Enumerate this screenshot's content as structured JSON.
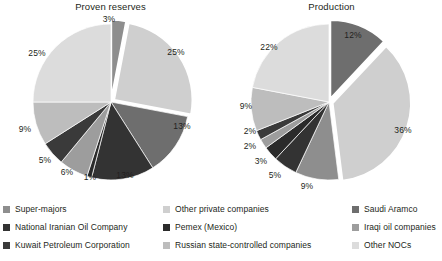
{
  "chart_data": [
    {
      "type": "pie",
      "title": "Proven reserves",
      "unit": "%",
      "labels_shown": true,
      "legend_position": "bottom",
      "grid": false,
      "categories": [
        "Super-majors",
        "Other private companies",
        "Saudi Aramco",
        "National Iranian Oil Company",
        "Pemex (Mexico)",
        "Iraqi oil companies",
        "Kuwait Petroleum Corporation",
        "Russian state-controlled companies",
        "Other NOCs"
      ],
      "values": [
        3,
        25,
        13,
        13,
        1,
        6,
        5,
        9,
        25
      ],
      "value_labels": [
        "3%",
        "25%",
        "13%",
        "13%",
        "1%",
        "6%",
        "5%",
        "9%",
        "25%"
      ],
      "exploded": [
        "Super-majors",
        "Other private companies"
      ]
    },
    {
      "type": "pie",
      "title": "Production",
      "unit": "%",
      "labels_shown": true,
      "legend_position": "bottom",
      "grid": false,
      "categories": [
        "Saudi Aramco",
        "Other private companies",
        "Super-majors",
        "National Iranian Oil Company",
        "Pemex (Mexico)",
        "Iraqi oil companies",
        "Kuwait Petroleum Corporation",
        "Russian state-controlled companies",
        "Other NOCs"
      ],
      "values": [
        12,
        36,
        9,
        5,
        3,
        2,
        2,
        9,
        22
      ],
      "value_labels": [
        "12%",
        "36%",
        "9%",
        "5%",
        "3%",
        "2%",
        "2%",
        "9%",
        "22%"
      ],
      "exploded": [
        "Saudi Aramco",
        "Other private companies"
      ]
    }
  ],
  "panels": {
    "left": {
      "title": "Proven reserves",
      "labels": [
        {
          "text": "3%",
          "x": 109,
          "y": 19
        },
        {
          "text": "25%",
          "x": 176,
          "y": 52
        },
        {
          "text": "13%",
          "x": 182,
          "y": 126
        },
        {
          "text": "13%",
          "x": 125,
          "y": 175
        },
        {
          "text": "1%",
          "x": 90,
          "y": 177
        },
        {
          "text": "6%",
          "x": 67,
          "y": 172
        },
        {
          "text": "5%",
          "x": 45,
          "y": 160
        },
        {
          "text": "9%",
          "x": 25,
          "y": 129
        },
        {
          "text": "25%",
          "x": 37,
          "y": 53
        }
      ]
    },
    "right": {
      "title": "Production",
      "labels": [
        {
          "text": "12%",
          "x": 353,
          "y": 35
        },
        {
          "text": "36%",
          "x": 403,
          "y": 130
        },
        {
          "text": "9%",
          "x": 307,
          "y": 186
        },
        {
          "text": "5%",
          "x": 275,
          "y": 175
        },
        {
          "text": "3%",
          "x": 261,
          "y": 161
        },
        {
          "text": "2%",
          "x": 250,
          "y": 146
        },
        {
          "text": "2%",
          "x": 250,
          "y": 131
        },
        {
          "text": "9%",
          "x": 246,
          "y": 106
        },
        {
          "text": "22%",
          "x": 269,
          "y": 47
        }
      ]
    }
  },
  "legend": {
    "columns": [
      {
        "items": [
          {
            "label": "Super-majors",
            "color": "#8e8e8e"
          },
          {
            "label": "National Iranian Oil Company",
            "color": "#333333"
          },
          {
            "label": "Kuwait Petroleum Corporation",
            "color": "#3a3a3a"
          }
        ]
      },
      {
        "items": [
          {
            "label": "Other private companies",
            "color": "#cfcfcf"
          },
          {
            "label": "Pemex (Mexico)",
            "color": "#2b2b2b"
          },
          {
            "label": "Russian state-controlled companies",
            "color": "#bdbdbd"
          }
        ]
      },
      {
        "items": [
          {
            "label": "Saudi Aramco",
            "color": "#6e6e6e"
          },
          {
            "label": "Iraqi oil companies",
            "color": "#9d9d9d"
          },
          {
            "label": "Other NOCs",
            "color": "#dcdcdc"
          }
        ]
      }
    ]
  },
  "palette": {
    "super_majors": "#8e8e8e",
    "other_private": "#cfcfcf",
    "saudi_aramco": "#6e6e6e",
    "niOC": "#333333",
    "pemex": "#2b2b2b",
    "iraqi": "#9d9d9d",
    "kuwait": "#3a3a3a",
    "russian": "#bdbdbd",
    "other_nocs": "#dcdcdc",
    "background": "#ffffff",
    "text": "#231f20"
  }
}
